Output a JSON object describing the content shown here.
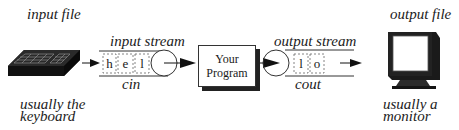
{
  "diagram": {
    "input_side": {
      "top_label": "input file",
      "bottom_label_line1": "usually the",
      "bottom_label_line2": "keyboard",
      "device_icon": "keyboard-icon"
    },
    "input_stream": {
      "title": "input stream",
      "name": "cin",
      "characters": [
        "h",
        "e",
        "l"
      ]
    },
    "program": {
      "line1": "Your",
      "line2": "Program"
    },
    "output_stream": {
      "title": "output stream",
      "name": "cout",
      "characters": [
        "l",
        "o"
      ]
    },
    "output_side": {
      "top_label": "output file",
      "bottom_label_line1": "usually a",
      "bottom_label_line2": "monitor",
      "device_icon": "monitor-icon"
    }
  }
}
